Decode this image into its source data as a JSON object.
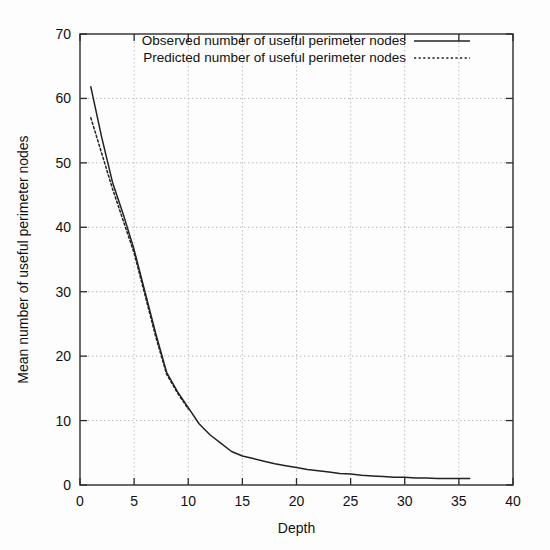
{
  "chart_data": {
    "type": "line",
    "title": "",
    "subtitle": "",
    "xlabel": "Depth",
    "ylabel": "Mean number of useful perimeter nodes",
    "xlim": [
      0,
      40
    ],
    "ylim": [
      0,
      70
    ],
    "xticks": [
      0,
      5,
      10,
      15,
      20,
      25,
      30,
      35,
      40
    ],
    "xtick_labels": [
      "0",
      "5",
      "10",
      "15",
      "20",
      "25",
      "30",
      "35",
      "40"
    ],
    "yticks": [
      0,
      10,
      20,
      30,
      40,
      50,
      60,
      70
    ],
    "ytick_labels": [
      "0",
      "10",
      "20",
      "30",
      "40",
      "50",
      "60",
      "70"
    ],
    "grid": true,
    "grid_style": "dotted",
    "legend_position": "top-center-inside",
    "legend_border": false,
    "series": [
      {
        "name": "Observed number of useful perimeter nodes",
        "style": "solid",
        "color": "#222222",
        "x": [
          1,
          2,
          3,
          4,
          5,
          6,
          7,
          8,
          9,
          10,
          11,
          12,
          13,
          14,
          15,
          16,
          17,
          18,
          19,
          20,
          21,
          22,
          23,
          24,
          25,
          26,
          27,
          28,
          29,
          30,
          31,
          32,
          33,
          34,
          35,
          36
        ],
        "values": [
          61.8,
          54.0,
          47.0,
          42.0,
          36.5,
          30.0,
          23.5,
          17.5,
          14.5,
          12.0,
          9.5,
          7.8,
          6.5,
          5.2,
          4.5,
          4.1,
          3.7,
          3.3,
          3.0,
          2.7,
          2.4,
          2.2,
          2.0,
          1.8,
          1.7,
          1.5,
          1.4,
          1.3,
          1.2,
          1.2,
          1.1,
          1.1,
          1.0,
          1.0,
          1.0,
          1.0
        ]
      },
      {
        "name": "Predicted number of useful perimeter nodes",
        "style": "dotted",
        "color": "#222222",
        "x": [
          1,
          2,
          3,
          4,
          5,
          6,
          7,
          8,
          9,
          10
        ],
        "values": [
          57.0,
          51.5,
          46.0,
          41.0,
          36.0,
          29.5,
          23.0,
          17.2,
          14.3,
          11.8
        ]
      }
    ],
    "colors": {
      "axis": "#2b2b2b",
      "grid": "#a8a8a8",
      "series": "#222222",
      "background": "#fdfdfd"
    }
  }
}
